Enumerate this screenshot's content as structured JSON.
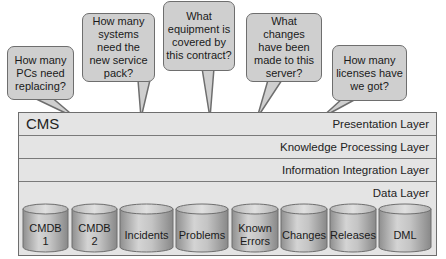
{
  "bubbles": [
    {
      "text": "How many PCs need replacing?"
    },
    {
      "text": "How many systems need the new service pack?"
    },
    {
      "text": "What equipment is covered by this contract?"
    },
    {
      "text": "What changes have been made to this server?"
    },
    {
      "text": "How many licenses have we got?"
    }
  ],
  "cms": {
    "title": "CMS",
    "layers": [
      {
        "label": "Presentation Layer"
      },
      {
        "label": "Knowledge Processing Layer"
      },
      {
        "label": "Information Integration Layer"
      },
      {
        "label": "Data Layer"
      }
    ]
  },
  "data_stores": [
    {
      "label": "CMDB 1"
    },
    {
      "label": "CMDB 2"
    },
    {
      "label": "Incidents"
    },
    {
      "label": "Problems"
    },
    {
      "label": "Known Errors"
    },
    {
      "label": "Changes"
    },
    {
      "label": "Releases"
    },
    {
      "label": "DML"
    }
  ],
  "colors": {
    "bubble_fill": "#cfcfcf",
    "border": "#6e6e6e",
    "layer_fill": "#e4e4e4",
    "cylinder_mid": "#bdbdbd"
  }
}
